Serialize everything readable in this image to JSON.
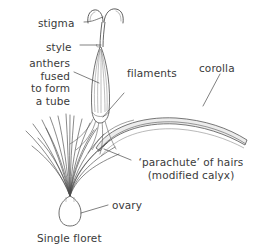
{
  "figure": {
    "caption": "Single floret",
    "ink_color": "#3a3a3a",
    "line_color": "#555555",
    "shade_color": "#e8e8e8",
    "background_color": "#ffffff"
  },
  "labels": {
    "stigma": "stigma",
    "style": "style",
    "anthers": "anthers\nfused\nto form\na tube",
    "filaments": "filaments",
    "corolla": "corolla",
    "parachute": "‘parachute’ of hairs\n(modified calyx)",
    "ovary": "ovary"
  },
  "diagram_parts": [
    "stigma",
    "style",
    "anther-tube",
    "filaments",
    "corolla",
    "pappus-hairs",
    "ovary"
  ]
}
